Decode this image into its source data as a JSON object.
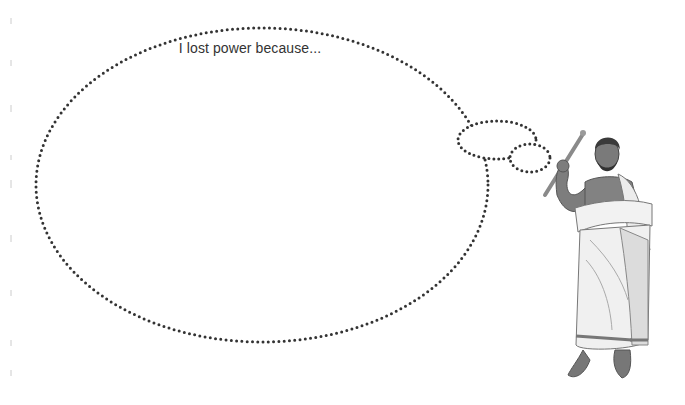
{
  "thought_bubble": {
    "text": "I lost power because...",
    "stroke_color": "#333333"
  }
}
